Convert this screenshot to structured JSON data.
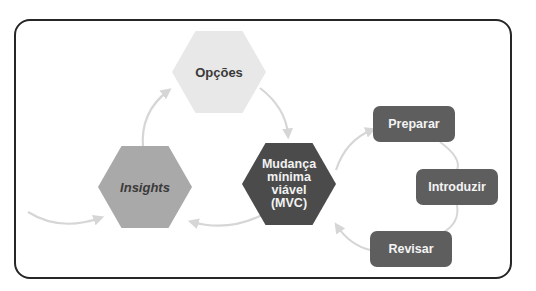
{
  "diagram": {
    "type": "cycle-flow",
    "nodes": {
      "options": {
        "label": "Opções",
        "shape": "hexagon",
        "color": "#e8e8e8"
      },
      "insights": {
        "label": "Insights",
        "shape": "hexagon",
        "color": "#a9a9a9"
      },
      "mvc": {
        "label": "Mudança mínima viável (MVC)",
        "lines": [
          "Mudança",
          "mínima",
          "viável",
          "(MVC)"
        ],
        "shape": "hexagon",
        "color": "#4b4b4b"
      }
    },
    "steps": [
      {
        "label": "Preparar",
        "color": "#5e5e5e"
      },
      {
        "label": "Introduzir",
        "color": "#5e5e5e"
      },
      {
        "label": "Revisar",
        "color": "#5e5e5e"
      }
    ],
    "edges": [
      {
        "from": "external",
        "to": "insights"
      },
      {
        "from": "insights",
        "to": "options"
      },
      {
        "from": "options",
        "to": "mvc"
      },
      {
        "from": "mvc",
        "to": "insights"
      },
      {
        "from": "mvc",
        "to": "Preparar"
      },
      {
        "from": "Preparar",
        "to": "Introduzir"
      },
      {
        "from": "Introduzir",
        "to": "Revisar"
      },
      {
        "from": "Revisar",
        "to": "mvc"
      }
    ],
    "arrow_color": "#d6d6d6",
    "frame_border_color": "#262626"
  }
}
